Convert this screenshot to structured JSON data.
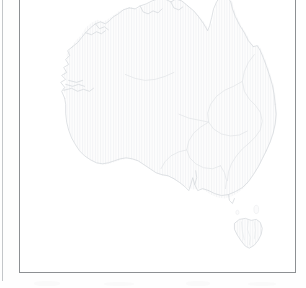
{
  "document": {
    "type": "scanned-page",
    "page_background": "#fefefe",
    "gutter_rule_color": "#b9bcbf"
  },
  "map_plate": {
    "frame_color": "#8d9093",
    "frame_fill": "#ffffff",
    "caption": "",
    "title": ""
  },
  "map": {
    "subject": "Australia",
    "style": "blank outline map",
    "coastline_color": "#d9dde0",
    "internal_boundary_color": "#e2e5e8",
    "land_fill": "#fdfdfd",
    "hatch_color": "#f4f5f6",
    "hatch_pattern": "vertical-lines",
    "features": [
      {
        "name": "mainland-australia"
      },
      {
        "name": "cape-york-peninsula"
      },
      {
        "name": "gulf-of-carpentaria"
      },
      {
        "name": "arnhem-land"
      },
      {
        "name": "kimberley-coast"
      },
      {
        "name": "shark-bay"
      },
      {
        "name": "great-australian-bight"
      },
      {
        "name": "spencer-gulf"
      },
      {
        "name": "eyre-peninsula"
      },
      {
        "name": "murray-darling-basin"
      },
      {
        "name": "great-dividing-range"
      },
      {
        "name": "tasmania"
      }
    ]
  },
  "smudges": {
    "a": "scan-artifact",
    "b": "scan-artifact",
    "c": "scan-artifact",
    "d": "scan-artifact"
  }
}
